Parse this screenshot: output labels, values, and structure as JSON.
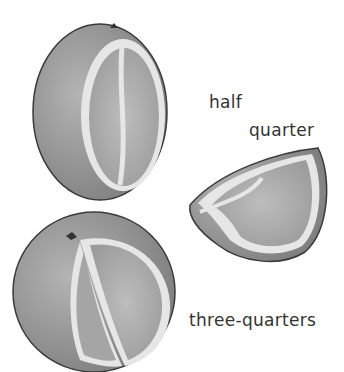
{
  "labels": {
    "half": "half",
    "quarter": "quarter",
    "three_quarters": "three-quarters"
  },
  "colors": {
    "peel": "#9a9a9a",
    "pulp": "#a8a8a8",
    "pith": "#e4e4e4",
    "outline": "#3a3a3a",
    "text": "#333333"
  }
}
